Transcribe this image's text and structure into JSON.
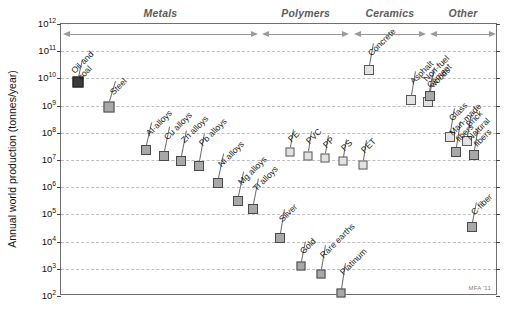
{
  "chart_data": {
    "type": "scatter",
    "title": "",
    "xlabel": "",
    "ylabel": "Annual world production (tonnes/year)",
    "ylim_log10": [
      2,
      12
    ],
    "ytick_labels": [
      "10^12",
      "10^11",
      "10^10",
      "10^9",
      "10^8",
      "10^7",
      "10^6",
      "10^5",
      "10^4",
      "10^3",
      "10^2"
    ],
    "grid": true,
    "legend": "none",
    "credit": "MFA '11",
    "category_bands": [
      {
        "name": "Metals",
        "x_start_pct": 0.5,
        "x_end_pct": 45.0,
        "arrow": "both"
      },
      {
        "name": "Polymers",
        "x_start_pct": 46.0,
        "x_end_pct": 66.0,
        "arrow": "both"
      },
      {
        "name": "Ceramics",
        "x_start_pct": 67.0,
        "x_end_pct": 83.5,
        "arrow": "both"
      },
      {
        "name": "Other",
        "x_start_pct": 84.5,
        "x_end_pct": 99.5,
        "arrow": "both"
      }
    ],
    "points": [
      {
        "label": "Oil and coal",
        "category": "Metals",
        "x_pct": 4.0,
        "value_log10": 9.85,
        "value": 7000000000.0,
        "marker": "dark",
        "size": 11,
        "label_dx": 4,
        "label_dy": -18,
        "lines": [
          "Oil and",
          "coal"
        ]
      },
      {
        "label": "Steel",
        "category": "Metals",
        "x_pct": 11.0,
        "value_log10": 8.95,
        "value": 900000000.0,
        "marker": "gray",
        "size": 11,
        "label_dx": 6,
        "label_dy": -20,
        "lines": [
          "Steel"
        ]
      },
      {
        "label": "Al-alloys",
        "category": "Metals",
        "x_pct": 19.5,
        "value_log10": 7.38,
        "value": 24000000.0,
        "marker": "gray",
        "size": 10,
        "label_dx": 5,
        "label_dy": -22,
        "lines": [
          "Al-alloys"
        ]
      },
      {
        "label": "Cu alloys",
        "category": "Metals",
        "x_pct": 23.5,
        "value_log10": 7.13,
        "value": 13500000.0,
        "marker": "gray",
        "size": 10,
        "label_dx": 5,
        "label_dy": -24,
        "lines": [
          "Cu alloys"
        ]
      },
      {
        "label": "Zn alloys",
        "category": "Metals",
        "x_pct": 27.5,
        "value_log10": 6.98,
        "value": 9500000.0,
        "marker": "gray",
        "size": 10,
        "label_dx": 5,
        "label_dy": -26,
        "lines": [
          "Zn alloys"
        ]
      },
      {
        "label": "Pb alloys",
        "category": "Metals",
        "x_pct": 31.5,
        "value_log10": 6.78,
        "value": 6000000.0,
        "marker": "gray",
        "size": 10,
        "label_dx": 5,
        "label_dy": -28,
        "lines": [
          "Pb alloys"
        ]
      },
      {
        "label": "Ni alloys",
        "category": "Metals",
        "x_pct": 36.0,
        "value_log10": 6.17,
        "value": 1500000.0,
        "marker": "gray",
        "size": 10,
        "label_dx": 5,
        "label_dy": -24,
        "lines": [
          "Ni alloys"
        ]
      },
      {
        "label": "Mg alloys",
        "category": "Metals",
        "x_pct": 40.5,
        "value_log10": 5.48,
        "value": 300000.0,
        "marker": "gray",
        "size": 10,
        "label_dx": 5,
        "label_dy": -24,
        "lines": [
          "Mg alloys"
        ]
      },
      {
        "label": "Ti alloys",
        "category": "Metals",
        "x_pct": 44.0,
        "value_log10": 5.2,
        "value": 160000.0,
        "marker": "gray",
        "size": 10,
        "label_dx": 5,
        "label_dy": -26,
        "lines": [
          "Ti alloys"
        ]
      },
      {
        "label": "Silver",
        "category": "Metals",
        "x_pct": 50.0,
        "value_log10": 4.15,
        "value": 14000.0,
        "marker": "gray",
        "size": 10,
        "label_dx": 4,
        "label_dy": -24,
        "lines": [
          "Silver"
        ]
      },
      {
        "label": "Gold",
        "category": "Metals",
        "x_pct": 55.0,
        "value_log10": 3.12,
        "value": 1300.0,
        "marker": "gray",
        "size": 9,
        "label_dx": 4,
        "label_dy": -20,
        "lines": [
          "Gold"
        ]
      },
      {
        "label": "Rare earths",
        "category": "Metals",
        "x_pct": 59.5,
        "value_log10": 2.82,
        "value": 650.0,
        "marker": "gray",
        "size": 9,
        "label_dx": 4,
        "label_dy": -24,
        "lines": [
          "Rare earths"
        ]
      },
      {
        "label": "Platinum",
        "category": "Metals",
        "x_pct": 64.0,
        "value_log10": 2.1,
        "value": 130.0,
        "marker": "gray",
        "size": 9,
        "label_dx": 4,
        "label_dy": -26,
        "lines": [
          "Platinum"
        ]
      },
      {
        "label": "PE",
        "category": "Polymers",
        "x_pct": 52.5,
        "value_log10": 7.3,
        "value": 20000000.0,
        "marker": "light",
        "size": 9,
        "label_dx": 3,
        "label_dy": -18,
        "lines": [
          "PE"
        ]
      },
      {
        "label": "PVC",
        "category": "Polymers",
        "x_pct": 56.5,
        "value_log10": 7.16,
        "value": 14500000.0,
        "marker": "light",
        "size": 9,
        "label_dx": 3,
        "label_dy": -20,
        "lines": [
          "PVC"
        ]
      },
      {
        "label": "PP",
        "category": "Polymers",
        "x_pct": 60.5,
        "value_log10": 7.08,
        "value": 12000000.0,
        "marker": "light",
        "size": 9,
        "label_dx": 3,
        "label_dy": -18,
        "lines": [
          "PP"
        ]
      },
      {
        "label": "PS",
        "category": "Polymers",
        "x_pct": 64.5,
        "value_log10": 6.95,
        "value": 9000000.0,
        "marker": "light",
        "size": 9,
        "label_dx": 3,
        "label_dy": -18,
        "lines": [
          "PS"
        ]
      },
      {
        "label": "PET",
        "category": "Polymers",
        "x_pct": 69.0,
        "value_log10": 6.82,
        "value": 6600000.0,
        "marker": "light",
        "size": 9,
        "label_dx": 3,
        "label_dy": -20,
        "lines": [
          "PET"
        ]
      },
      {
        "label": "Concrete",
        "category": "Ceramics",
        "x_pct": 70.5,
        "value_log10": 10.3,
        "value": 20000000000.0,
        "marker": "light",
        "size": 10,
        "label_dx": 4,
        "label_dy": -22,
        "lines": [
          "Concrete"
        ]
      },
      {
        "label": "Asphalt",
        "category": "Ceramics",
        "x_pct": 80.0,
        "value_log10": 9.22,
        "value": 1700000000.0,
        "marker": "light",
        "size": 10,
        "label_dx": 4,
        "label_dy": -24,
        "lines": [
          "Asphalt"
        ]
      },
      {
        "label": "Cement",
        "category": "Ceramics",
        "x_pct": 84.0,
        "value_log10": 9.12,
        "value": 1300000000.0,
        "marker": "light",
        "size": 10,
        "label_dx": 4,
        "label_dy": -22,
        "lines": [
          "Cement"
        ]
      },
      {
        "label": "Glass",
        "category": "Ceramics",
        "x_pct": 89.0,
        "value_log10": 7.85,
        "value": 70000000.0,
        "marker": "light",
        "size": 10,
        "label_dx": 4,
        "label_dy": -24,
        "lines": [
          "Glass"
        ]
      },
      {
        "label": "Brick",
        "category": "Ceramics",
        "x_pct": 93.0,
        "value_log10": 7.7,
        "value": 50000000.0,
        "marker": "light",
        "size": 10,
        "label_dx": 4,
        "label_dy": -22,
        "lines": [
          "Brick"
        ]
      },
      {
        "label": "Non-fuel woods",
        "category": "Other",
        "x_pct": 84.5,
        "value_log10": 9.35,
        "value": 2200000000.0,
        "marker": "gray",
        "size": 10,
        "label_dx": 4,
        "label_dy": -24,
        "lines": [
          "Non-fuel",
          "woods"
        ]
      },
      {
        "label": "Man-made fibers",
        "category": "Other",
        "x_pct": 90.5,
        "value_log10": 7.3,
        "value": 20000000.0,
        "marker": "gray",
        "size": 10,
        "label_dx": 4,
        "label_dy": -26,
        "lines": [
          "Man-made",
          "fibers"
        ]
      },
      {
        "label": "Natural fibers",
        "category": "Other",
        "x_pct": 94.5,
        "value_log10": 7.2,
        "value": 16000000.0,
        "marker": "gray",
        "size": 10,
        "label_dx": 4,
        "label_dy": -24,
        "lines": [
          "Natural",
          "fibers"
        ]
      },
      {
        "label": "C-fiber",
        "category": "Other",
        "x_pct": 94.0,
        "value_log10": 4.55,
        "value": 35000.0,
        "marker": "gray",
        "size": 10,
        "label_dx": 4,
        "label_dy": -20,
        "lines": [
          "C-fiber"
        ]
      }
    ]
  },
  "colors": {
    "frame": "#6f6f6f",
    "grid": "#bfbfbf",
    "marker_gray": "#a8a8a8",
    "marker_dark": "#3c3c3c",
    "marker_light": "#e2e2e2",
    "category_text": "#5b5b5b",
    "axis_text": "#111111"
  }
}
